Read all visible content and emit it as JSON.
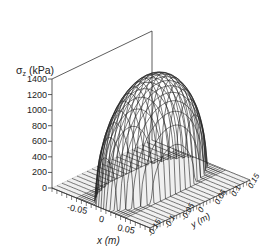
{
  "chart_data": {
    "type": "surface3d",
    "title": "",
    "zlabel": "σz (kPa)",
    "zlabel_main": "σ",
    "zlabel_sub": "z",
    "zlabel_unit": " (kPa)",
    "xlabel": "x (m)",
    "ylabel": "y (m)",
    "zlim": [
      0,
      1400
    ],
    "xlim": [
      -0.1,
      0.1
    ],
    "ylim": [
      -0.15,
      0.15
    ],
    "z_ticks": [
      0,
      200,
      400,
      600,
      800,
      1000,
      1200,
      1400
    ],
    "x_ticks": [
      -0.05,
      0,
      0.05
    ],
    "x_tick_labels": [
      "-0.05",
      "0",
      "0.05"
    ],
    "y_ticks": [
      -0.15,
      -0.1,
      -0.05,
      0,
      0.05,
      0.1,
      0.15
    ],
    "y_tick_labels": [
      "-0.15",
      "-0.1",
      "-0.05",
      "0",
      "0.05",
      "0.1",
      "0.15"
    ],
    "surface": {
      "description": "Hertzian-type elliptical contact pressure distribution, wireframe mesh",
      "peak_value": 1400,
      "contact_half_width_x": 0.05,
      "contact_half_length_y": 0.15,
      "mesh_lines_x": 21,
      "mesh_lines_y": 21
    },
    "colors": {
      "mesh": "#222222",
      "base": "#f0f0f0",
      "axis": "#333333"
    }
  }
}
